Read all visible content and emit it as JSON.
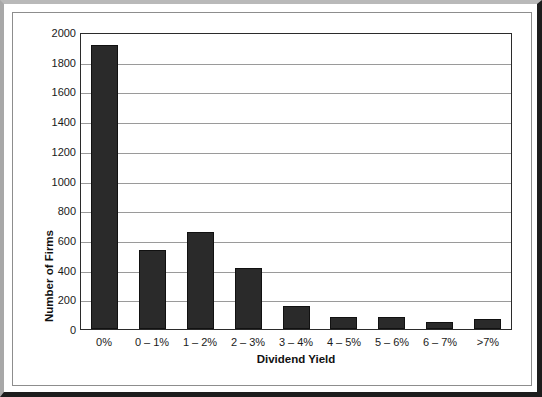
{
  "chart_data": {
    "type": "bar",
    "title": "",
    "xlabel": "Dividend Yield",
    "ylabel": "Number of Firms",
    "categories": [
      "0%",
      "0 – 1%",
      "1 – 2%",
      "2 – 3%",
      "3 – 4%",
      "4 – 5%",
      "5 – 6%",
      "6 – 7%",
      ">7%"
    ],
    "values": [
      1910,
      530,
      655,
      410,
      155,
      80,
      80,
      45,
      70
    ],
    "ylim": [
      0,
      2000
    ],
    "ytick_labels": [
      "2000",
      "1800",
      "1600",
      "1400",
      "1200",
      "1000",
      "800",
      "600",
      "400",
      "200",
      "0"
    ],
    "ytick_values": [
      2000,
      1800,
      1600,
      1400,
      1200,
      1000,
      800,
      600,
      400,
      200,
      0
    ],
    "grid": true,
    "legend": "none",
    "bar_color": "#2a2a2a",
    "gridline_color": "#9a9a9a",
    "axis_color": "#2b2b2b"
  }
}
